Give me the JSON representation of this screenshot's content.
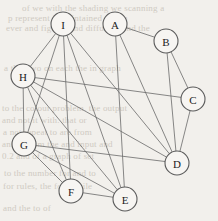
{
  "figure": {
    "name": "undirected-graph",
    "background_color": "#f2f0ec",
    "node_fill": "#f7f5f2",
    "node_stroke": "#5b5b5b",
    "edge_color": "#6a6a6a",
    "width": 218,
    "height": 221
  },
  "nodes": [
    {
      "id": "A",
      "label": "A",
      "x": 115,
      "y": 24,
      "r": 12
    },
    {
      "id": "B",
      "label": "B",
      "x": 166,
      "y": 41,
      "r": 12
    },
    {
      "id": "C",
      "label": "C",
      "x": 193,
      "y": 99,
      "r": 12
    },
    {
      "id": "D",
      "label": "D",
      "x": 177,
      "y": 163,
      "r": 12
    },
    {
      "id": "E",
      "label": "E",
      "x": 125,
      "y": 199,
      "r": 12
    },
    {
      "id": "F",
      "label": "F",
      "x": 71,
      "y": 191,
      "r": 12
    },
    {
      "id": "G",
      "label": "G",
      "x": 24,
      "y": 144,
      "r": 12
    },
    {
      "id": "H",
      "label": "H",
      "x": 23,
      "y": 76,
      "r": 12
    },
    {
      "id": "I",
      "label": "I",
      "x": 63,
      "y": 24,
      "r": 12
    }
  ],
  "edges": [
    {
      "from": "A",
      "to": "B"
    },
    {
      "from": "A",
      "to": "D"
    },
    {
      "from": "A",
      "to": "E"
    },
    {
      "from": "B",
      "to": "C"
    },
    {
      "from": "B",
      "to": "D"
    },
    {
      "from": "C",
      "to": "D"
    },
    {
      "from": "C",
      "to": "H"
    },
    {
      "from": "D",
      "to": "I"
    },
    {
      "from": "D",
      "to": "H"
    },
    {
      "from": "D",
      "to": "G"
    },
    {
      "from": "E",
      "to": "F"
    },
    {
      "from": "E",
      "to": "I"
    },
    {
      "from": "E",
      "to": "H"
    },
    {
      "from": "E",
      "to": "G"
    },
    {
      "from": "F",
      "to": "I"
    },
    {
      "from": "F",
      "to": "G"
    },
    {
      "from": "F",
      "to": "H"
    },
    {
      "from": "G",
      "to": "H"
    },
    {
      "from": "G",
      "to": "I"
    },
    {
      "from": "H",
      "to": "I"
    }
  ],
  "background_text": [
    {
      "text": "of we with the shading we scanning a",
      "x": 22,
      "y": 3
    },
    {
      "text": "p represent it maintained the an",
      "x": 8,
      "y": 13
    },
    {
      "text": "ever and figures and diffusion and the",
      "x": 6,
      "y": 23
    },
    {
      "text": "a that two on each the in graph",
      "x": 4,
      "y": 63
    },
    {
      "text": "to the colour problem. the output",
      "x": 2,
      "y": 103
    },
    {
      "text": "and not it with. that or",
      "x": 2,
      "y": 115
    },
    {
      "text": "a not repeat to are from",
      "x": 3,
      "y": 127
    },
    {
      "text": "and digram the and input and",
      "x": 2,
      "y": 139
    },
    {
      "text": "0.2 and of a graph of set",
      "x": 2,
      "y": 151
    },
    {
      "text": "to the number for and to",
      "x": 4,
      "y": 168
    },
    {
      "text": "for rules, the for. While",
      "x": 3,
      "y": 181
    },
    {
      "text": "and the to of",
      "x": 3,
      "y": 203
    }
  ]
}
